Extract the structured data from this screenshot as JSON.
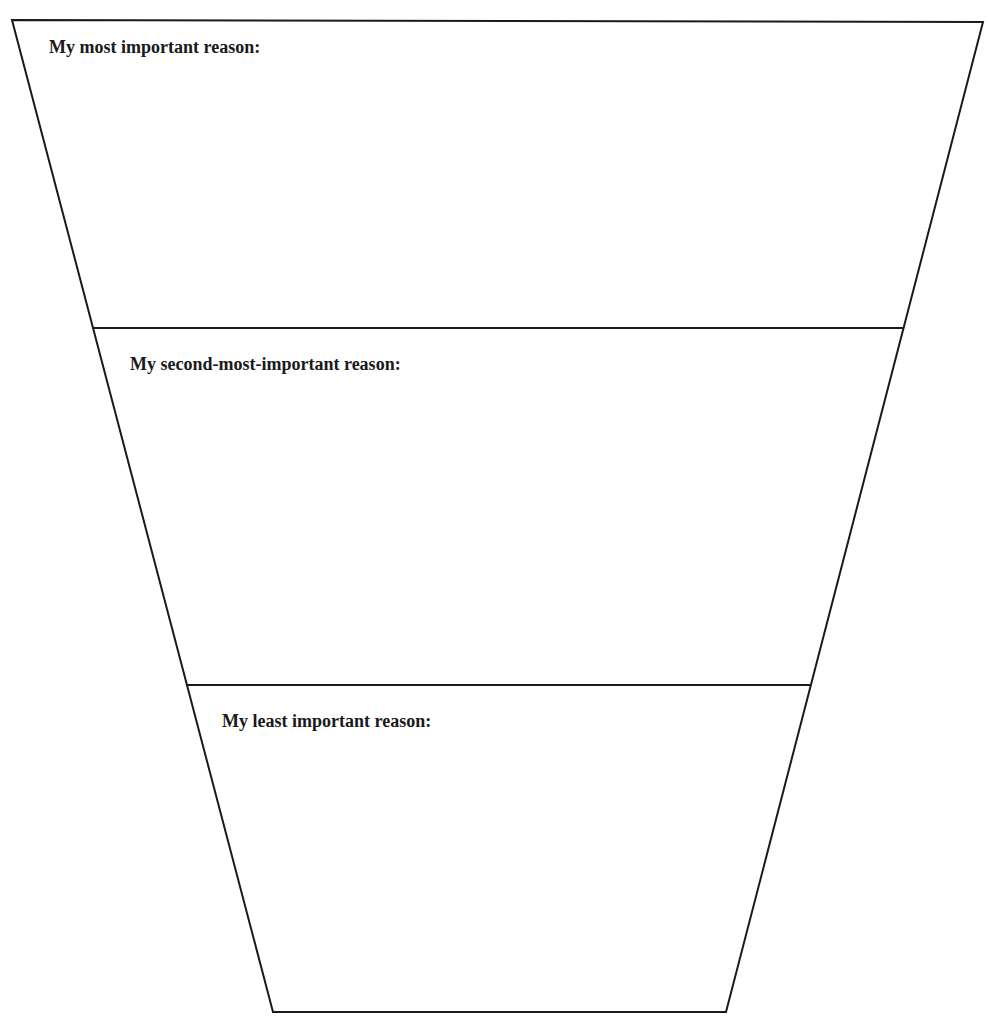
{
  "diagram": {
    "type": "funnel",
    "stroke_color": "#1a1a1a",
    "background_color": "#ffffff",
    "outline": {
      "top_left": [
        12,
        20
      ],
      "top_right": [
        983,
        22
      ],
      "bottom_right": [
        726,
        1012
      ],
      "bottom_left": [
        273,
        1012
      ]
    },
    "sections": [
      {
        "label": "My most important reason:",
        "rank": 1,
        "divider_below": {
          "y": 328,
          "x1": 92,
          "x2": 903
        },
        "response": ""
      },
      {
        "label": "My second-most-important reason:",
        "rank": 2,
        "divider_below": {
          "y": 685,
          "x1": 187,
          "x2": 810
        },
        "response": ""
      },
      {
        "label": "My least important reason:",
        "rank": 3,
        "divider_below": null,
        "response": ""
      }
    ]
  }
}
